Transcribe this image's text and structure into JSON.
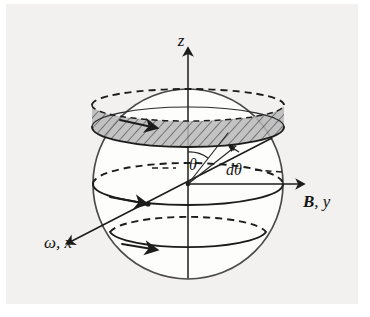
{
  "figure": {
    "background_color": "#f2f1ef",
    "ink_color": "#1c1c1c",
    "band_color": "#b9b9b9"
  },
  "labels": {
    "z_axis": "z",
    "b_y_axis_bold": "B",
    "b_y_axis_rest": ", y",
    "omega_x_axis": "ω, x",
    "theta": "θ",
    "d_theta": "dθ"
  },
  "geometry": {
    "sphere": {
      "cx": 188,
      "cy": 184,
      "r": 95
    },
    "z_axis": {
      "x": 188,
      "y_top": 42,
      "y_bottom": 278
    },
    "y_axis": {
      "x_start": 188,
      "x_end": 306,
      "y": 184
    },
    "x_axis": {
      "x_start": 268,
      "y_start": 140,
      "x_end": 64,
      "y_end": 245
    },
    "band": {
      "top_ry": 14,
      "bottom_ry": 17,
      "top_y": 118,
      "bottom_y": 137
    },
    "latitudes": [
      {
        "name": "equator",
        "cy": 184,
        "rx": 95,
        "ry": 20
      },
      {
        "name": "lower-latitude",
        "cy": 232,
        "rx": 80,
        "ry": 17
      }
    ]
  },
  "elements": {
    "hatched_ring_name": "current-band",
    "equator_name": "equator-circle",
    "lower_circle_name": "lower-latitude-circle",
    "theta_arc_name": "theta-angle-arc",
    "dtheta_arc_name": "dtheta-angle-arc"
  }
}
